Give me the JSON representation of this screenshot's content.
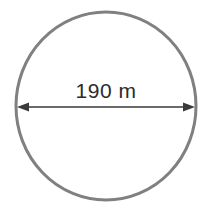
{
  "figure": {
    "name": "circle-diameter-diagram",
    "type": "geometry-diagram",
    "shape": "circle",
    "background_color": "#ffffff"
  },
  "circle": {
    "name": "circle-outline",
    "stroke_color": "#808080",
    "fill_color": "#ffffff",
    "stroke_width": 3,
    "center_x": 106,
    "center_y": 106,
    "radius_x": 90,
    "radius_y": 94
  },
  "dimension": {
    "name": "diameter-dimension",
    "label": "190 m",
    "value": 190,
    "unit": "m",
    "measures": "diameter",
    "line_color": "#3a3a3a",
    "text_color": "#2b2b2b",
    "arrow_style": "double-headed",
    "line_y": 107,
    "start_x": 17,
    "end_x": 195,
    "label_x": 106,
    "label_baseline_y": 98
  }
}
